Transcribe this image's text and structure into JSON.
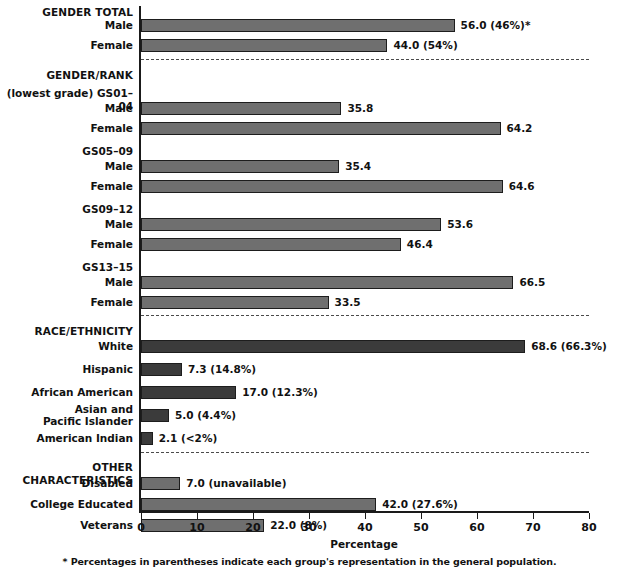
{
  "chart_data": {
    "type": "bar",
    "title": "",
    "subtitle": "",
    "xlabel": "Percentage",
    "ylabel": "",
    "xlim": [
      0,
      85
    ],
    "xticks": [
      0,
      10,
      20,
      30,
      40,
      50,
      60,
      70,
      80
    ],
    "grid": false,
    "legend": null,
    "orientation": "horizontal",
    "footnote": "* Percentages in parentheses indicate each group's representation in the general population.",
    "sections": [
      {
        "heading": "GENDER TOTAL",
        "subheadings": [],
        "bars": [
          {
            "category": "Male",
            "value": 56.0,
            "label": "56.0 (46%)*",
            "shade": "light"
          },
          {
            "category": "Female",
            "value": 44.0,
            "label": "44.0 (54%)",
            "shade": "light"
          }
        ]
      },
      {
        "heading": "GENDER/RANK",
        "subheadings": [
          "(lowest grade) GS01–04",
          "GS05–09",
          "GS09–12",
          "GS13–15"
        ],
        "bars": [
          {
            "category": "Male",
            "value": 35.8,
            "label": "35.8",
            "shade": "light",
            "group": "(lowest grade) GS01–04"
          },
          {
            "category": "Female",
            "value": 64.2,
            "label": "64.2",
            "shade": "light",
            "group": "(lowest grade) GS01–04"
          },
          {
            "category": "Male",
            "value": 35.4,
            "label": "35.4",
            "shade": "light",
            "group": "GS05–09"
          },
          {
            "category": "Female",
            "value": 64.6,
            "label": "64.6",
            "shade": "light",
            "group": "GS05–09"
          },
          {
            "category": "Male",
            "value": 53.6,
            "label": "53.6",
            "shade": "light",
            "group": "GS09–12"
          },
          {
            "category": "Female",
            "value": 46.4,
            "label": "46.4",
            "shade": "light",
            "group": "GS09–12"
          },
          {
            "category": "Male",
            "value": 66.5,
            "label": "66.5",
            "shade": "light",
            "group": "GS13–15"
          },
          {
            "category": "Female",
            "value": 33.5,
            "label": "33.5",
            "shade": "light",
            "group": "GS13–15"
          }
        ]
      },
      {
        "heading": "RACE/ETHNICITY",
        "subheadings": [],
        "bars": [
          {
            "category": "White",
            "value": 68.6,
            "label": "68.6 (66.3%)",
            "shade": "dark"
          },
          {
            "category": "Hispanic",
            "value": 7.3,
            "label": "7.3 (14.8%)",
            "shade": "dark"
          },
          {
            "category": "African American",
            "value": 17.0,
            "label": "17.0 (12.3%)",
            "shade": "dark"
          },
          {
            "category": "Asian and\nPacific Islander",
            "value": 5.0,
            "label": "5.0 (4.4%)",
            "shade": "dark"
          },
          {
            "category": "American Indian",
            "value": 2.1,
            "label": "2.1 (<2%)",
            "shade": "dark"
          }
        ]
      },
      {
        "heading": "OTHER CHARACTERISTICS",
        "subheadings": [],
        "bars": [
          {
            "category": "Disabled",
            "value": 7.0,
            "label": "7.0 (unavailable)",
            "shade": "light"
          },
          {
            "category": "College Educated",
            "value": 42.0,
            "label": "42.0 (27.6%)",
            "shade": "light"
          },
          {
            "category": "Veterans",
            "value": 22.0,
            "label": "22.0 (8%)",
            "shade": "light"
          }
        ]
      }
    ]
  },
  "rows": [
    {
      "kind": "heading",
      "text": "GENDER TOTAL",
      "y": 6
    },
    {
      "kind": "bar",
      "text": "Male",
      "y": 19,
      "value": 56.0,
      "label": "56.0 (46%)*",
      "shade": "light"
    },
    {
      "kind": "bar",
      "text": "Female",
      "y": 39,
      "value": 44.0,
      "label": "44.0 (54%)",
      "shade": "light"
    },
    {
      "kind": "sep",
      "text": "",
      "y": 59
    },
    {
      "kind": "heading",
      "text": "GENDER/RANK",
      "y": 69
    },
    {
      "kind": "subhead",
      "text": "(lowest grade) GS01–04",
      "y": 87
    },
    {
      "kind": "bar",
      "text": "Male",
      "y": 102,
      "value": 35.8,
      "label": "35.8",
      "shade": "light"
    },
    {
      "kind": "bar",
      "text": "Female",
      "y": 122,
      "value": 64.2,
      "label": "64.2",
      "shade": "light"
    },
    {
      "kind": "subhead",
      "text": "GS05–09",
      "y": 145
    },
    {
      "kind": "bar",
      "text": "Male",
      "y": 160,
      "value": 35.4,
      "label": "35.4",
      "shade": "light"
    },
    {
      "kind": "bar",
      "text": "Female",
      "y": 180,
      "value": 64.6,
      "label": "64.6",
      "shade": "light"
    },
    {
      "kind": "subhead",
      "text": "GS09–12",
      "y": 203
    },
    {
      "kind": "bar",
      "text": "Male",
      "y": 218,
      "value": 53.6,
      "label": "53.6",
      "shade": "light"
    },
    {
      "kind": "bar",
      "text": "Female",
      "y": 238,
      "value": 46.4,
      "label": "46.4",
      "shade": "light"
    },
    {
      "kind": "subhead",
      "text": "GS13–15",
      "y": 261
    },
    {
      "kind": "bar",
      "text": "Male",
      "y": 276,
      "value": 66.5,
      "label": "66.5",
      "shade": "light"
    },
    {
      "kind": "bar",
      "text": "Female",
      "y": 296,
      "value": 33.5,
      "label": "33.5",
      "shade": "light"
    },
    {
      "kind": "sep",
      "text": "",
      "y": 315
    },
    {
      "kind": "heading",
      "text": "RACE/ETHNICITY",
      "y": 325
    },
    {
      "kind": "bar",
      "text": "White",
      "y": 340,
      "value": 68.6,
      "label": "68.6 (66.3%)",
      "shade": "dark"
    },
    {
      "kind": "bar",
      "text": "Hispanic",
      "y": 363,
      "value": 7.3,
      "label": "7.3 (14.8%)",
      "shade": "dark"
    },
    {
      "kind": "bar",
      "text": "African American",
      "y": 386,
      "value": 17.0,
      "label": "17.0 (12.3%)",
      "shade": "dark"
    },
    {
      "kind": "bar2",
      "text": "Asian and\nPacific Islander",
      "y": 409,
      "value": 5.0,
      "label": "5.0 (4.4%)",
      "shade": "dark"
    },
    {
      "kind": "bar",
      "text": "American Indian",
      "y": 432,
      "value": 2.1,
      "label": "2.1 (<2%)",
      "shade": "dark"
    },
    {
      "kind": "sep",
      "text": "",
      "y": 452
    },
    {
      "kind": "heading",
      "text": "OTHER CHARACTERISTICS",
      "y": 461
    },
    {
      "kind": "bar",
      "text": "Disabled",
      "y": 477,
      "value": 7.0,
      "label": "7.0 (unavailable)",
      "shade": "light"
    },
    {
      "kind": "bar",
      "text": "College Educated",
      "y": 498,
      "value": 42.0,
      "label": "42.0 (27.6%)",
      "shade": "light"
    },
    {
      "kind": "bar",
      "text": "Veterans",
      "y": 519,
      "value": 22.0,
      "label": "22.0 (8%)",
      "shade": "light"
    }
  ],
  "axis": {
    "ticks": [
      "0",
      "10",
      "20",
      "30",
      "40",
      "50",
      "60",
      "70",
      "80"
    ],
    "title": "Percentage"
  },
  "footnote": {
    "text": "* Percentages in parentheses indicate each group's representation in the general population."
  },
  "colors": {
    "bar_light": "#6f6f6f",
    "bar_dark": "#3b3b3b",
    "bar_border": "#1d1d1d",
    "axis": "#1a1a1a",
    "text": "#111111",
    "background": "#ffffff"
  }
}
